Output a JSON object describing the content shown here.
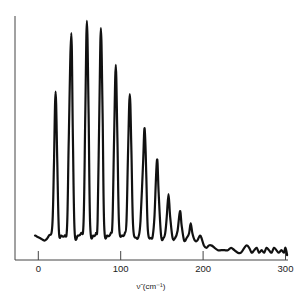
{
  "chart_data": {
    "type": "line",
    "title": "",
    "xlabel": "ν̃ (cm⁻¹)",
    "ylabel": "",
    "xlim": [
      -28,
      303
    ],
    "ylim": [
      0,
      100
    ],
    "xticks": [
      0,
      100,
      200,
      300
    ],
    "xtick_labels": [
      "0",
      "100",
      "200",
      "300"
    ],
    "yticks": [],
    "grid": false,
    "legend": null,
    "series": [
      {
        "name": "spectrum",
        "color": "#111111",
        "peaks": [
          {
            "x": 21,
            "y": 69
          },
          {
            "x": 40,
            "y": 93
          },
          {
            "x": 59,
            "y": 98
          },
          {
            "x": 76,
            "y": 95
          },
          {
            "x": 94,
            "y": 80
          },
          {
            "x": 111,
            "y": 68
          },
          {
            "x": 129,
            "y": 54
          },
          {
            "x": 144,
            "y": 41
          },
          {
            "x": 158,
            "y": 27
          },
          {
            "x": 172,
            "y": 20
          },
          {
            "x": 185,
            "y": 15
          },
          {
            "x": 196,
            "y": 10
          }
        ],
        "points": [
          [
            -4,
            10
          ],
          [
            2,
            9
          ],
          [
            8,
            8
          ],
          [
            13,
            10
          ],
          [
            17,
            14
          ],
          [
            19,
            40
          ],
          [
            21,
            69
          ],
          [
            23,
            40
          ],
          [
            25,
            12
          ],
          [
            28,
            10
          ],
          [
            32,
            10
          ],
          [
            35,
            14
          ],
          [
            37,
            50
          ],
          [
            40,
            93
          ],
          [
            42,
            50
          ],
          [
            44,
            12
          ],
          [
            48,
            10
          ],
          [
            52,
            11
          ],
          [
            55,
            16
          ],
          [
            57,
            60
          ],
          [
            59,
            98
          ],
          [
            61,
            60
          ],
          [
            63,
            14
          ],
          [
            67,
            10
          ],
          [
            70,
            11
          ],
          [
            72,
            16
          ],
          [
            74,
            60
          ],
          [
            76,
            95
          ],
          [
            78,
            60
          ],
          [
            80,
            14
          ],
          [
            84,
            10
          ],
          [
            88,
            11
          ],
          [
            90,
            16
          ],
          [
            92,
            50
          ],
          [
            94,
            80
          ],
          [
            96,
            50
          ],
          [
            98,
            14
          ],
          [
            102,
            10
          ],
          [
            105,
            11
          ],
          [
            107,
            16
          ],
          [
            109,
            45
          ],
          [
            111,
            68
          ],
          [
            113,
            45
          ],
          [
            115,
            14
          ],
          [
            119,
            9
          ],
          [
            122,
            10
          ],
          [
            124,
            16
          ],
          [
            127,
            38
          ],
          [
            129,
            54
          ],
          [
            131,
            36
          ],
          [
            133,
            12
          ],
          [
            137,
            9
          ],
          [
            139,
            10
          ],
          [
            141,
            18
          ],
          [
            144,
            41
          ],
          [
            146,
            28
          ],
          [
            149,
            10
          ],
          [
            152,
            9
          ],
          [
            154,
            11
          ],
          [
            156,
            18
          ],
          [
            158,
            27
          ],
          [
            160,
            18
          ],
          [
            163,
            9
          ],
          [
            166,
            9
          ],
          [
            169,
            12
          ],
          [
            172,
            20
          ],
          [
            174,
            14
          ],
          [
            177,
            8
          ],
          [
            180,
            9
          ],
          [
            183,
            11
          ],
          [
            185,
            15
          ],
          [
            187,
            11
          ],
          [
            190,
            8
          ],
          [
            193,
            8
          ],
          [
            196,
            10
          ],
          [
            198,
            9
          ],
          [
            201,
            6
          ],
          [
            204,
            5
          ],
          [
            207,
            6
          ],
          [
            210,
            6
          ],
          [
            214,
            5
          ],
          [
            218,
            4
          ],
          [
            222,
            4
          ],
          [
            226,
            4
          ],
          [
            230,
            4
          ],
          [
            234,
            5
          ],
          [
            238,
            4
          ],
          [
            242,
            3
          ],
          [
            246,
            3
          ],
          [
            250,
            5
          ],
          [
            253,
            6
          ],
          [
            256,
            5
          ],
          [
            259,
            3
          ],
          [
            262,
            4
          ],
          [
            265,
            5
          ],
          [
            268,
            3
          ],
          [
            271,
            4
          ],
          [
            274,
            3
          ],
          [
            277,
            5
          ],
          [
            280,
            4
          ],
          [
            283,
            3
          ],
          [
            286,
            5
          ],
          [
            289,
            4
          ],
          [
            292,
            3
          ],
          [
            295,
            4
          ],
          [
            298,
            3
          ],
          [
            300,
            5
          ],
          [
            302,
            2
          ]
        ]
      }
    ]
  }
}
